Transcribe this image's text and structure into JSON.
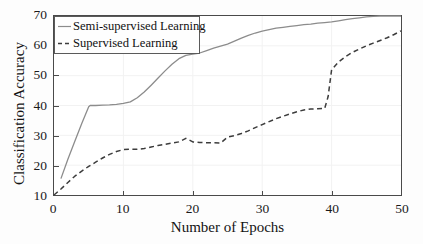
{
  "chart_data": {
    "type": "line",
    "title": "",
    "xlabel": "Number of Epochs",
    "ylabel": "Classification Accuracy",
    "xlim": [
      0,
      50
    ],
    "ylim": [
      10,
      70
    ],
    "xticks": [
      0,
      10,
      20,
      30,
      40,
      50
    ],
    "yticks": [
      10,
      20,
      30,
      40,
      50,
      60,
      70
    ],
    "grid": true,
    "legend_position": "upper left",
    "series": [
      {
        "name": "Semi-supervised Learning",
        "style": "solid",
        "color": "#8c8c8c",
        "x": [
          1,
          2,
          3,
          4,
          5,
          5.2,
          6,
          7,
          8,
          9,
          10,
          11,
          12,
          13,
          14,
          15,
          16,
          17,
          18,
          19,
          20,
          21,
          22,
          23,
          24,
          25,
          26,
          27,
          28,
          29,
          30,
          31,
          32,
          33,
          34,
          35,
          36,
          37,
          38,
          39,
          40,
          41,
          42,
          43,
          44,
          45,
          46,
          47,
          48,
          49,
          50
        ],
        "y": [
          15.5,
          22.0,
          28.0,
          34.0,
          39.6,
          40.0,
          40.0,
          40.1,
          40.2,
          40.4,
          40.7,
          41.2,
          42.6,
          44.5,
          46.8,
          49.2,
          51.6,
          53.8,
          55.7,
          56.8,
          57.2,
          57.6,
          58.4,
          59.2,
          59.9,
          60.6,
          61.6,
          62.6,
          63.5,
          64.3,
          64.9,
          65.4,
          65.9,
          66.2,
          66.5,
          66.8,
          67.1,
          67.3,
          67.6,
          67.8,
          68.0,
          68.4,
          68.8,
          69.1,
          69.4,
          69.7,
          69.9,
          70.0,
          70.0,
          70.0,
          70.0
        ]
      },
      {
        "name": "Supervised Learning",
        "style": "dashed",
        "color": "#3c3c3c",
        "x": [
          0,
          1,
          2,
          3,
          4,
          5,
          6,
          7,
          8,
          9,
          10,
          11,
          12,
          13,
          14,
          15,
          16,
          17,
          18,
          19,
          20,
          21,
          22,
          23,
          24,
          25,
          26,
          27,
          28,
          29,
          30,
          31,
          32,
          33,
          34,
          35,
          36,
          37,
          38,
          39,
          39.5,
          40,
          41,
          42,
          43,
          44,
          45,
          46,
          47,
          48,
          49,
          50
        ],
        "y": [
          10.0,
          12.0,
          14.2,
          16.3,
          18.0,
          19.6,
          21.0,
          22.4,
          23.6,
          24.6,
          25.2,
          25.4,
          25.3,
          25.6,
          26.1,
          26.6,
          27.0,
          27.4,
          27.8,
          29.0,
          27.8,
          27.6,
          27.5,
          27.5,
          27.4,
          29.4,
          29.9,
          30.6,
          31.5,
          32.6,
          33.6,
          34.6,
          35.6,
          36.4,
          37.2,
          37.9,
          38.5,
          38.8,
          38.9,
          39.0,
          43.0,
          52.0,
          54.6,
          56.4,
          57.8,
          58.9,
          60.0,
          60.9,
          61.8,
          62.7,
          63.8,
          65.0
        ]
      }
    ]
  },
  "legend": {
    "items": [
      {
        "label": "Semi-supervised Learning"
      },
      {
        "label": "Supervised Learning"
      }
    ]
  }
}
